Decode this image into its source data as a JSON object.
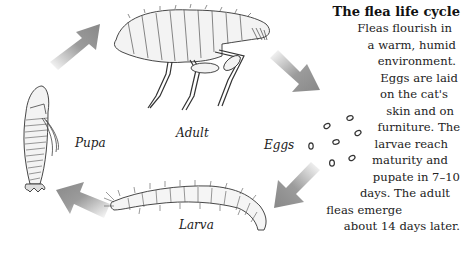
{
  "diagram": {
    "title": "The flea life cycle",
    "stages": [
      {
        "id": "adult",
        "label": "Adult"
      },
      {
        "id": "eggs",
        "label": "Eggs"
      },
      {
        "id": "larva",
        "label": "Larva"
      },
      {
        "id": "pupa",
        "label": "Pupa"
      }
    ],
    "flow": [
      "Adult",
      "Eggs",
      "Larva",
      "Pupa",
      "Adult"
    ],
    "description_lines": [
      "Fleas flourish in",
      "a warm, humid",
      "environment.",
      "Eggs are laid",
      "on the cat's",
      "skin and on",
      "furniture. The",
      "larvae reach",
      "maturity and",
      "pupate in 7–10",
      "days. The adult",
      "fleas emerge",
      "about 14 days later."
    ],
    "arrow_color": "#8a8a8a",
    "line_color": "#333333"
  }
}
